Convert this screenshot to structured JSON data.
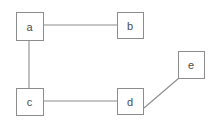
{
  "diagram": {
    "background_color": "#ffffff",
    "stroke_color": "#8c8c8c",
    "label_color": "#4a4a4a",
    "nodes": [
      {
        "id": "a",
        "label": "a",
        "x": 16,
        "y": 12,
        "w": 27,
        "h": 28
      },
      {
        "id": "b",
        "label": "b",
        "x": 117,
        "y": 12,
        "w": 26,
        "h": 26
      },
      {
        "id": "c",
        "label": "c",
        "x": 16,
        "y": 88,
        "w": 27,
        "h": 27
      },
      {
        "id": "d",
        "label": "d",
        "x": 117,
        "y": 88,
        "w": 26,
        "h": 26
      },
      {
        "id": "e",
        "label": "e",
        "x": 178,
        "y": 51,
        "w": 26,
        "h": 27
      }
    ],
    "edges": [
      {
        "id": "edge-a-b",
        "from": "a",
        "to": "b",
        "x1": 43,
        "y1": 25,
        "x2": 117,
        "y2": 25
      },
      {
        "id": "edge-a-c",
        "from": "a",
        "to": "c",
        "x1": 29,
        "y1": 40,
        "x2": 29,
        "y2": 88
      },
      {
        "id": "edge-c-d",
        "from": "c",
        "to": "d",
        "x1": 43,
        "y1": 101,
        "x2": 117,
        "y2": 101
      },
      {
        "id": "edge-d-e",
        "from": "d",
        "to": "e",
        "x1": 144,
        "y1": 108,
        "x2": 179,
        "y2": 78
      }
    ]
  }
}
